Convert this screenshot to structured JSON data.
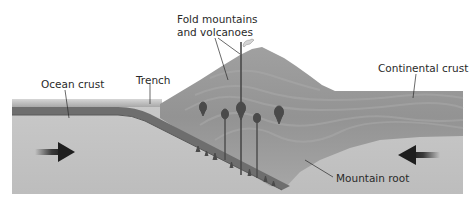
{
  "diagram": {
    "labels": {
      "ocean_crust": "Ocean crust",
      "trench": "Trench",
      "fold_mountains_line1": "Fold mountains",
      "fold_mountains_line2": "and volcanoes",
      "continental_crust": "Continental crust",
      "mountain_root": "Mountain root"
    },
    "arrows": [
      {
        "name": "left-plate-motion",
        "direction": "right"
      },
      {
        "name": "right-plate-motion",
        "direction": "left"
      }
    ],
    "colors": {
      "background": "#ffffff",
      "mantle": "#c2c2c2",
      "ocean_crust": "#6e6e6e",
      "continental_crust": "#9a9a9a",
      "mountain": "#8a8a8a",
      "magma": "#4a4a4a",
      "arrow": "#2a2a2a",
      "text": "#2a2a2a"
    }
  }
}
